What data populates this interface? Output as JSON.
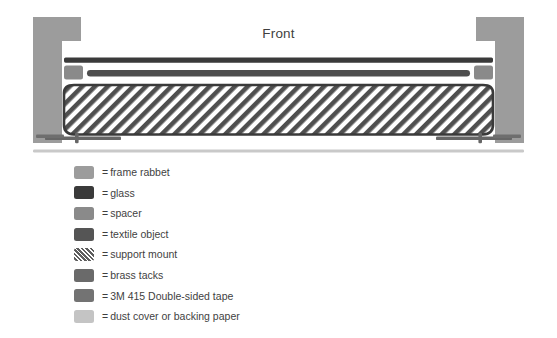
{
  "diagram": {
    "title": "Front",
    "orientation_label": "Front",
    "colors": {
      "frame_rabbet": "#9c9c9c",
      "glass": "#3a3a3a",
      "spacer": "#8a8a8a",
      "textile_object": "#4b4b4b",
      "support_mount_stripe": "#5d5d5d",
      "support_mount_ground": "#ffffff",
      "brass_tacks": "#666666",
      "tape_3m_415": "#6e6e6e",
      "dust_cover": "#c9c9c9",
      "background": "#ffffff",
      "text": "#3f3f3f"
    },
    "parts": [
      {
        "name": "frame-rabbet-left",
        "label": "frame rabbet"
      },
      {
        "name": "frame-rabbet-right",
        "label": "frame rabbet"
      },
      {
        "name": "glass-pane",
        "label": "glass"
      },
      {
        "name": "spacer-left",
        "label": "spacer"
      },
      {
        "name": "spacer-right",
        "label": "spacer"
      },
      {
        "name": "textile-object",
        "label": "textile object"
      },
      {
        "name": "support-mount",
        "label": "support mount"
      },
      {
        "name": "brass-tack-left",
        "label": "brass tacks"
      },
      {
        "name": "brass-tack-right",
        "label": "brass tacks"
      },
      {
        "name": "tape-strip-left",
        "label": "3M 415 Double-sided tape"
      },
      {
        "name": "tape-strip-right",
        "label": "3M 415 Double-sided tape"
      },
      {
        "name": "dust-cover",
        "label": "dust cover or backing paper"
      }
    ]
  },
  "legend": {
    "separator": "=",
    "items": [
      {
        "label": "frame rabbet",
        "color": "#9c9c9c",
        "pattern": "solid"
      },
      {
        "label": "glass",
        "color": "#3a3a3a",
        "pattern": "solid"
      },
      {
        "label": "spacer",
        "color": "#8a8a8a",
        "pattern": "solid"
      },
      {
        "label": "textile object",
        "color": "#555555",
        "pattern": "solid"
      },
      {
        "label": "support mount",
        "color": "#5d5d5d",
        "pattern": "hatch"
      },
      {
        "label": "brass tacks",
        "color": "#6a6a6a",
        "pattern": "solid"
      },
      {
        "label": "3M 415 Double-sided tape",
        "color": "#737373",
        "pattern": "solid"
      },
      {
        "label": "dust cover or backing paper",
        "color": "#c4c4c4",
        "pattern": "solid"
      }
    ]
  }
}
